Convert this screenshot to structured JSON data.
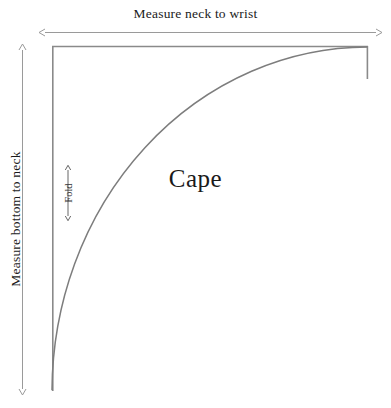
{
  "diagram": {
    "title_text": "Cape",
    "labels": {
      "top_measure": "Measure neck to wrist",
      "left_measure": "Measure bottom to neck",
      "fold": "Fold",
      "shape_name": "Cape"
    },
    "colors": {
      "outline": "#8a8a8a",
      "arc": "#7d7d7d",
      "arrow": "#9a9a9a",
      "text": "#1a1a1a",
      "fold_text": "#333333",
      "background": "#ffffff"
    },
    "geometry": {
      "rect_left": 52,
      "rect_top": 46,
      "rect_right": 368,
      "rect_bottom": 391,
      "arc_center_x": 52,
      "arc_center_y": 391,
      "arc_radius_x": 316,
      "arc_radius_y": 345,
      "top_arrow_y": 32,
      "top_arrow_x1": 43,
      "top_arrow_x2": 378,
      "left_arrow_x": 22,
      "left_arrow_y1": 48,
      "left_arrow_y2": 391,
      "fold_line_x": 58,
      "fold_arrow_top_y": 166,
      "fold_arrow_bottom_y": 220
    }
  }
}
